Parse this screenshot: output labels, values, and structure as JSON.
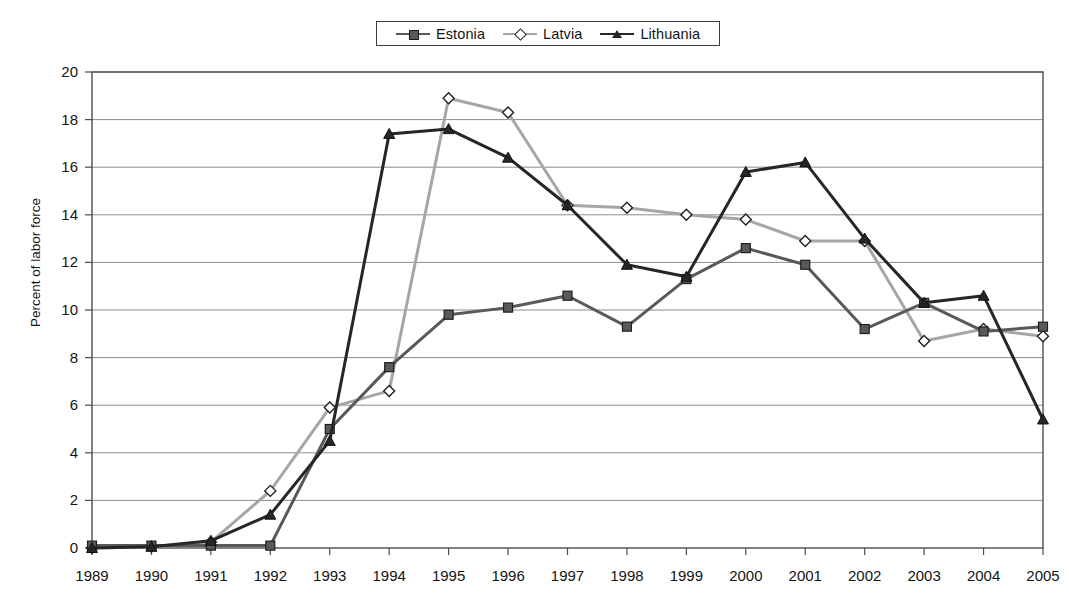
{
  "chart_data": {
    "type": "line",
    "title": "",
    "xlabel": "",
    "ylabel": "Percent of labor force",
    "categories": [
      "1989",
      "1990",
      "1991",
      "1992",
      "1993",
      "1994",
      "1995",
      "1996",
      "1997",
      "1998",
      "1999",
      "2000",
      "2001",
      "2002",
      "2003",
      "2004",
      "2005"
    ],
    "x": [
      1989,
      1990,
      1991,
      1992,
      1993,
      1994,
      1995,
      1996,
      1997,
      1998,
      1999,
      2000,
      2001,
      2002,
      2003,
      2004,
      2005
    ],
    "xlim": [
      1989,
      2005
    ],
    "ylim": [
      0,
      20
    ],
    "ytick_labels": [
      "0",
      "2",
      "4",
      "6",
      "8",
      "10",
      "12",
      "14",
      "16",
      "18",
      "20"
    ],
    "ytick_values": [
      0,
      2,
      4,
      6,
      8,
      10,
      12,
      14,
      16,
      18,
      20
    ],
    "grid": "horizontal",
    "legend_position": "top-center",
    "series": [
      {
        "name": "Estonia",
        "color": "#595959",
        "marker": "square",
        "values": [
          0.1,
          0.1,
          0.1,
          0.1,
          5.0,
          7.6,
          9.8,
          10.1,
          10.6,
          9.3,
          11.3,
          12.6,
          11.9,
          9.2,
          10.3,
          9.1,
          9.3
        ]
      },
      {
        "name": "Latvia",
        "color": "#a6a6a6",
        "marker": "diamond",
        "values": [
          0.0,
          0.05,
          0.25,
          2.4,
          5.9,
          6.6,
          18.9,
          18.3,
          14.4,
          14.3,
          14.0,
          13.8,
          12.9,
          12.9,
          8.7,
          9.2,
          8.9
        ]
      },
      {
        "name": "Lithuania",
        "color": "#262626",
        "marker": "triangle",
        "values": [
          0.0,
          0.05,
          0.3,
          1.4,
          4.5,
          17.4,
          17.6,
          16.4,
          14.4,
          11.9,
          11.4,
          15.8,
          16.2,
          13.0,
          10.3,
          10.6,
          5.4
        ]
      }
    ]
  },
  "legend": {
    "entries": [
      {
        "label": "Estonia"
      },
      {
        "label": "Latvia"
      },
      {
        "label": "Lithuania"
      }
    ]
  }
}
